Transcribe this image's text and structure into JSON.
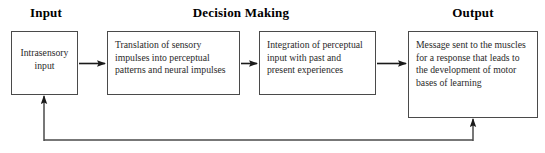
{
  "headers": [
    {
      "label": "Input"
    },
    {
      "label": "Decision Making"
    },
    {
      "label": "Output"
    }
  ],
  "boxes": [
    {
      "name": "intrasensory-input",
      "text": "Intrasensory input",
      "align": "center"
    },
    {
      "name": "translation",
      "text": "Translation of sensory impulses into perceptual patterns and neural impulses",
      "align": "left"
    },
    {
      "name": "integration",
      "text": "Integration of perceptual input with past and present experiences",
      "align": "left"
    },
    {
      "name": "message",
      "text": "Message sent to the muscles for a response that leads to the development of motor bases of learning",
      "align": "left"
    }
  ],
  "colors": {
    "stroke": "#4a4a4a",
    "arrow": "#1a1a1a",
    "text": "#2a2a2a",
    "header": "#000000",
    "background": "#ffffff"
  }
}
